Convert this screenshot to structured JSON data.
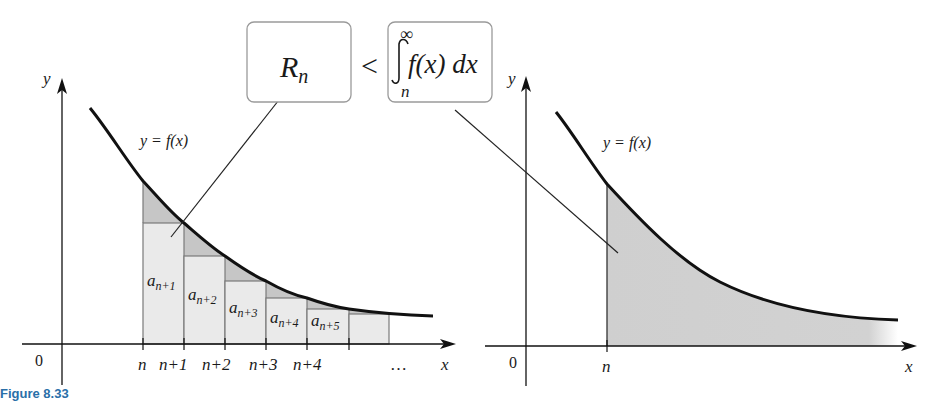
{
  "figure": {
    "caption": "Figure 8.33",
    "comparison": {
      "left_box": "R",
      "left_box_sub": "n",
      "operator": "<",
      "integral_upper": "∞",
      "integral_lower": "n",
      "integrand": "f(x) dx"
    },
    "left_panel": {
      "y_axis_label": "y",
      "x_axis_label": "x",
      "origin_label": "0",
      "curve_label": "y = f(x)",
      "x_ticks": [
        "n",
        "n+1",
        "n+2",
        "n+3",
        "n+4"
      ],
      "ellipsis": "…",
      "rect_labels": [
        {
          "base": "a",
          "sub": "n+1"
        },
        {
          "base": "a",
          "sub": "n+2"
        },
        {
          "base": "a",
          "sub": "n+3"
        },
        {
          "base": "a",
          "sub": "n+4"
        },
        {
          "base": "a",
          "sub": "n+5"
        }
      ]
    },
    "right_panel": {
      "y_axis_label": "y",
      "x_axis_label": "x",
      "origin_label": "0",
      "curve_label": "y = f(x)",
      "x_tick": "n"
    },
    "colors": {
      "rect_fill": "#e9e9e9",
      "excess_fill": "#c8c8c8",
      "area_fill": "#cfcfcf",
      "curve": "#111111",
      "caption": "#2a6fa8"
    }
  }
}
